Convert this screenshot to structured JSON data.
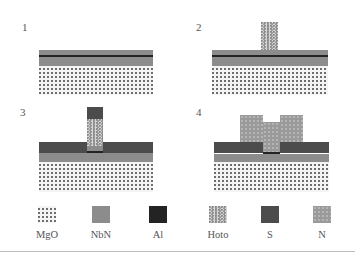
{
  "figure": {
    "steps": [
      {
        "id": 1,
        "label": "1"
      },
      {
        "id": 2,
        "label": "2"
      },
      {
        "id": 3,
        "label": "3"
      },
      {
        "id": 4,
        "label": "4"
      }
    ],
    "legend": [
      {
        "key": "mgo",
        "label": "MgO",
        "pattern": "grid-dots",
        "color": "#6e6e6e"
      },
      {
        "key": "nbn",
        "label": "NbN",
        "pattern": "solid",
        "color": "#8c8c8c"
      },
      {
        "key": "al",
        "label": "Al",
        "pattern": "solid",
        "color": "#232323"
      },
      {
        "key": "hoto",
        "label": "Hoto",
        "pattern": "speckle",
        "color": "#d6d6d6"
      },
      {
        "key": "s",
        "label": "S",
        "pattern": "dark-speckle",
        "color": "#3c3c3c"
      },
      {
        "key": "n",
        "label": "N",
        "pattern": "dots",
        "color": "#9a9a9a"
      }
    ]
  }
}
